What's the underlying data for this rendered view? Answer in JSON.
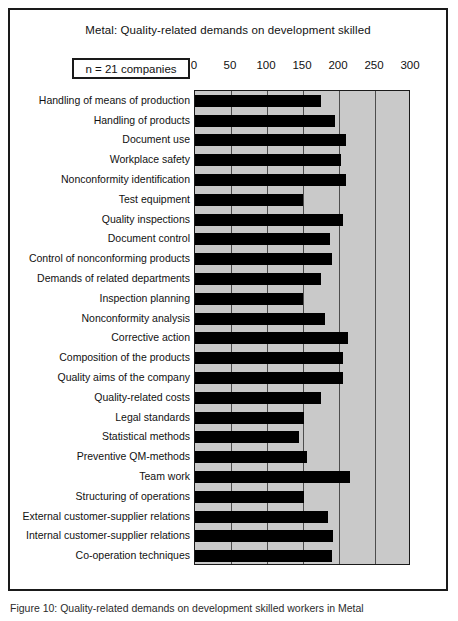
{
  "figure": {
    "title": "Metal: Quality-related demands on development skilled",
    "sample_size_label": "n = 21 companies",
    "caption": "Figure 10: Quality-related demands on development skilled workers in Metal"
  },
  "chart_data": {
    "type": "bar",
    "orientation": "horizontal",
    "title": "Metal: Quality-related demands on development skilled",
    "xlabel": "",
    "ylabel": "",
    "xlim": [
      0,
      300
    ],
    "xticks": [
      0,
      50,
      100,
      150,
      200,
      250,
      300
    ],
    "xtick_labels": [
      "0",
      "50",
      "100",
      "150",
      "200",
      "250",
      "300"
    ],
    "grid": true,
    "legend": false,
    "bar_color": "#000000",
    "plot_background": "#c9c9c9",
    "annotation": "n = 21 companies",
    "categories": [
      "Handling of means of production",
      "Handling of products",
      "Document use",
      "Workplace safety",
      "Nonconformity identification",
      "Test equipment",
      "Quality inspections",
      "Document control",
      "Control of nonconforming products",
      "Demands of related departments",
      "Inspection planning",
      "Nonconformity analysis",
      "Corrective action",
      "Composition of the  products",
      "Quality aims of the company",
      "Quality-related costs",
      "Legal standards",
      "Statistical methods",
      "Preventive QM-methods",
      "Team work",
      "Structuring of operations",
      "External customer-supplier relations",
      "Internal customer-supplier relations",
      "Co-operation techniques"
    ],
    "values": [
      175,
      195,
      210,
      203,
      210,
      150,
      205,
      188,
      190,
      175,
      150,
      180,
      212,
      205,
      205,
      175,
      152,
      145,
      155,
      215,
      152,
      185,
      192,
      190
    ]
  }
}
